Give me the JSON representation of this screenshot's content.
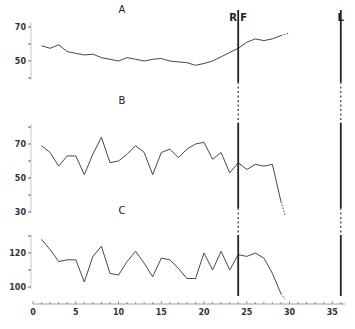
{
  "chart_data": {
    "type": "line",
    "title": "",
    "xlabel": "",
    "x_ticks": [
      0,
      5,
      10,
      15,
      20,
      25,
      30,
      35
    ],
    "xlim": [
      0,
      36
    ],
    "markers": [
      {
        "label": "R F",
        "x": 24
      },
      {
        "label": "L",
        "x": 36
      }
    ],
    "panels": [
      {
        "label": "A",
        "y_ticks_labeled": [
          50,
          70
        ],
        "y_ticks": [
          40,
          50,
          60,
          70
        ],
        "ylim": [
          40,
          70
        ],
        "x": [
          1,
          2,
          3,
          4,
          5,
          6,
          7,
          8,
          9,
          10,
          11,
          12,
          13,
          14,
          15,
          16,
          17,
          18,
          19,
          20,
          21,
          22,
          23,
          24,
          25,
          26,
          27,
          28,
          29
        ],
        "values": [
          59,
          57.5,
          59.5,
          55.5,
          54.5,
          53.5,
          54,
          52,
          51,
          50,
          52,
          51,
          50,
          51,
          51.5,
          50,
          49.5,
          49,
          47.5,
          48.5,
          50,
          52.5,
          55,
          57.5,
          61,
          63,
          62,
          63,
          65
        ],
        "dotted_extension": {
          "x": [
            29,
            30
          ],
          "values": [
            65,
            66.5
          ]
        }
      },
      {
        "label": "B",
        "y_ticks_labeled": [
          30,
          50,
          70
        ],
        "y_ticks": [
          30,
          40,
          50,
          60,
          70,
          80
        ],
        "ylim": [
          30,
          80
        ],
        "x": [
          1,
          2,
          3,
          4,
          5,
          6,
          7,
          8,
          9,
          10,
          11,
          12,
          13,
          14,
          15,
          16,
          17,
          18,
          19,
          20,
          21,
          22,
          23,
          24,
          25,
          26,
          27,
          28,
          29
        ],
        "values": [
          69,
          65,
          57,
          63,
          63,
          52,
          64,
          74,
          59,
          60,
          64,
          69,
          65,
          52,
          65,
          67,
          62,
          67,
          70,
          71,
          61,
          65,
          53,
          59,
          55,
          58,
          57,
          58,
          36
        ],
        "dotted_extension": {
          "x": [
            29,
            29.5
          ],
          "values": [
            36,
            28
          ]
        }
      },
      {
        "label": "C",
        "y_ticks_labeled": [
          100,
          120
        ],
        "y_ticks": [
          100,
          110,
          120,
          130
        ],
        "ylim": [
          97,
          130
        ],
        "x": [
          1,
          2,
          3,
          4,
          5,
          6,
          7,
          8,
          9,
          10,
          11,
          12,
          13,
          14,
          15,
          16,
          17,
          18,
          19,
          20,
          21,
          22,
          23,
          24,
          25,
          26,
          27,
          28,
          29
        ],
        "values": [
          128,
          122,
          115,
          116,
          116,
          103,
          118,
          124,
          108,
          107,
          115,
          121,
          114,
          106,
          117,
          116,
          111,
          105,
          105,
          120,
          110,
          121,
          110,
          119,
          118,
          120,
          117,
          108,
          96
        ],
        "dotted_extension": {
          "x": [
            29,
            29.5
          ],
          "values": [
            96,
            93
          ]
        }
      }
    ]
  }
}
